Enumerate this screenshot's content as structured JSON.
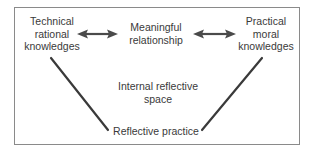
{
  "diagram": {
    "type": "triangle-concept-map",
    "frame": {
      "border_color": "#8a8a8a",
      "background": "#ffffff"
    },
    "line_color": "#3a3a3a",
    "nodes": {
      "technical": {
        "line1": "Technical",
        "line2": "rational",
        "line3": "knowledges"
      },
      "relationship": {
        "line1": "Meaningful",
        "line2": "relationship"
      },
      "practical": {
        "line1": "Practical",
        "line2": "moral",
        "line3": "knowledges"
      },
      "internal_space": {
        "line1": "Internal reflective",
        "line2": "space"
      },
      "reflective_practice": {
        "line1": "Reflective practice"
      }
    },
    "edges": [
      {
        "from": "technical",
        "to": "relationship",
        "style": "double-arrow"
      },
      {
        "from": "relationship",
        "to": "practical",
        "style": "double-arrow"
      },
      {
        "from": "technical",
        "to": "reflective_practice",
        "style": "line"
      },
      {
        "from": "practical",
        "to": "reflective_practice",
        "style": "line"
      }
    ]
  }
}
